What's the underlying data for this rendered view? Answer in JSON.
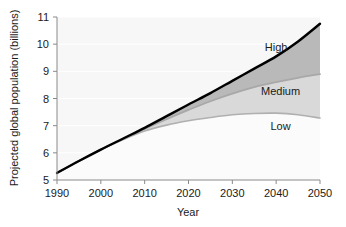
{
  "chart_data": {
    "type": "area",
    "title": "",
    "subtitle": "",
    "xlabel": "Year",
    "ylabel": "Projected global population (billions)",
    "xlim": [
      1990,
      2050
    ],
    "ylim": [
      5,
      11
    ],
    "xticks": [
      1990,
      2000,
      2010,
      2020,
      2030,
      2040,
      2050
    ],
    "yticks": [
      5,
      6,
      7,
      8,
      9,
      10,
      11
    ],
    "xtick_labels": [
      "1990",
      "2000",
      "2010",
      "2020",
      "2030",
      "2040",
      "2050"
    ],
    "ytick_labels": [
      "5",
      "6",
      "7",
      "8",
      "9",
      "10",
      "11"
    ],
    "grid": "horizontal",
    "legend_position": "inline-right",
    "x": [
      1990,
      1995,
      2000,
      2005,
      2010,
      2015,
      2020,
      2025,
      2030,
      2035,
      2040,
      2045,
      2050
    ],
    "series": [
      {
        "name": "High",
        "label": "High",
        "color": "#000000",
        "fill": "#b9b9b9",
        "values": [
          5.26,
          5.7,
          6.12,
          6.52,
          6.92,
          7.35,
          7.78,
          8.2,
          8.65,
          9.1,
          9.55,
          10.1,
          10.75
        ]
      },
      {
        "name": "Medium",
        "label": "Medium",
        "color": "#a8a8a8",
        "fill": "#d9d9d9",
        "values": [
          5.26,
          5.7,
          6.12,
          6.5,
          6.88,
          7.24,
          7.58,
          7.9,
          8.18,
          8.42,
          8.6,
          8.76,
          8.9
        ]
      },
      {
        "name": "Low",
        "label": "Low",
        "color": "#b0b0b0",
        "fill": "#fbfbfb",
        "values": [
          5.26,
          5.7,
          6.12,
          6.48,
          6.8,
          7.02,
          7.18,
          7.3,
          7.4,
          7.45,
          7.46,
          7.4,
          7.28
        ]
      }
    ],
    "annotations": [
      {
        "text": "High",
        "x": 2040,
        "y": 9.9
      },
      {
        "text": "Medium",
        "x": 2041,
        "y": 8.28
      },
      {
        "text": "Low",
        "x": 2041,
        "y": 7.0
      }
    ]
  },
  "axes": {
    "y_title": "Projected global population (billions)",
    "x_title": "Year"
  }
}
